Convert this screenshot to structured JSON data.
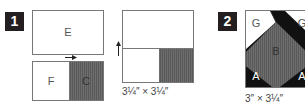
{
  "steps": [
    {
      "number": "1",
      "before": {
        "pieces": [
          {
            "label": "E",
            "shaded": false
          },
          {
            "label": "F",
            "shaded": false
          },
          {
            "label": "C",
            "shaded": true
          }
        ],
        "arrow": "right"
      },
      "after": {
        "arrow": "up",
        "caption": "3¼″ × 3¼″"
      }
    },
    {
      "number": "2",
      "pieces": [
        {
          "label": "G",
          "shaded": false
        },
        {
          "label": "G",
          "shaded": false
        },
        {
          "label": "B",
          "shaded": true
        },
        {
          "label": "A",
          "shaded": false
        },
        {
          "label": "A",
          "shaded": false
        }
      ],
      "caption": "3″ × 3¼″"
    }
  ],
  "colors": {
    "badge": "#231f20",
    "outline": "#777777",
    "shade": "#6b6b6b",
    "dark": "#111111"
  }
}
